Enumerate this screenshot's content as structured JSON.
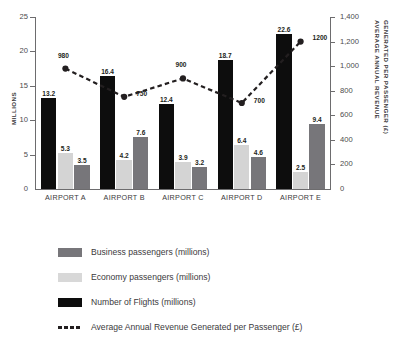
{
  "chart_data": {
    "type": "bar",
    "title": "",
    "subtitle": "",
    "categories": [
      "AIRPORT A",
      "AIRPORT B",
      "AIRPORT C",
      "AIRPORT D",
      "AIRPORT E"
    ],
    "xlabel": "",
    "ylabel": "MILLIONS",
    "ylabel_right_line1": "AVERAGE ANNUAL REVENUE",
    "ylabel_right_line2": "GENERATED PER PASSENGER (£)",
    "ylim": [
      0,
      25
    ],
    "ylim_right": [
      0,
      1400
    ],
    "yticks": [
      "0",
      "5",
      "10",
      "15",
      "20",
      "25"
    ],
    "ytick_values": [
      0,
      5,
      10,
      15,
      20,
      25
    ],
    "yticks_right": [
      "0",
      "200",
      "400",
      "600",
      "800",
      "1,000",
      "1,200",
      "1,400"
    ],
    "ytick_values_right": [
      0,
      200,
      400,
      600,
      800,
      1000,
      1200,
      1400
    ],
    "grid": false,
    "legend_position": "bottom",
    "bar_order": [
      "Number of Flights (millions)",
      "Economy passengers (millions)",
      "Business passengers (millions)"
    ],
    "series": [
      {
        "name": "Number of Flights (millions)",
        "type": "bar",
        "axis": "left",
        "color": "#0d0d0d",
        "values": [
          13.2,
          16.4,
          12.4,
          18.7,
          22.6
        ],
        "labels": [
          "13.2",
          "16.4",
          "12.4",
          "18.7",
          "22.6"
        ]
      },
      {
        "name": "Economy passengers (millions)",
        "type": "bar",
        "axis": "left",
        "color": "#d4d4d4",
        "values": [
          5.3,
          4.2,
          3.9,
          6.4,
          2.5
        ],
        "labels": [
          "5.3",
          "4.2",
          "3.9",
          "6.4",
          "2.5"
        ]
      },
      {
        "name": "Business passengers (millions)",
        "type": "bar",
        "axis": "left",
        "color": "#77767a",
        "values": [
          3.5,
          7.6,
          3.2,
          4.6,
          9.4
        ],
        "labels": [
          "3.5",
          "7.6",
          "3.2",
          "4.6",
          "9.4"
        ]
      },
      {
        "name": "Average Annual Revenue Generated per Passenger (£)",
        "type": "line",
        "axis": "right",
        "color": "#231f20",
        "style": "dotted",
        "marker": "circle",
        "values": [
          980,
          750,
          900,
          700,
          1200
        ],
        "labels": [
          "980",
          "750",
          "900",
          "700",
          "1200"
        ]
      }
    ]
  },
  "legend": {
    "items": [
      {
        "label": "Business passengers (millions)",
        "swatch": "#77767a",
        "kind": "swatch"
      },
      {
        "label": "Economy passengers (millions)",
        "swatch": "#d8d8d8",
        "kind": "swatch"
      },
      {
        "label": "Number of Flights (millions)",
        "swatch": "#0d0d0d",
        "kind": "swatch"
      },
      {
        "label": "Average Annual Revenue Generated per Passenger (£)",
        "swatch": "#231f20",
        "kind": "dashed-line"
      }
    ]
  },
  "colors": {
    "business": "#77767a",
    "economy": "#d4d4d4",
    "flights": "#0d0d0d",
    "line": "#231f20",
    "axis": "#6d6c6e",
    "text": "#3b3a3c",
    "background": "#ffffff"
  }
}
